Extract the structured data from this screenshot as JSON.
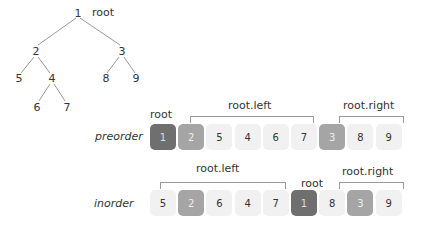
{
  "tree": {
    "root_label": "root",
    "nodes": [
      {
        "v": "1",
        "x": 78,
        "y": 13
      },
      {
        "v": "2",
        "x": 36,
        "y": 51
      },
      {
        "v": "3",
        "x": 122,
        "y": 51
      },
      {
        "v": "5",
        "x": 19,
        "y": 78
      },
      {
        "v": "4",
        "x": 52,
        "y": 78
      },
      {
        "v": "8",
        "x": 106,
        "y": 78
      },
      {
        "v": "9",
        "x": 136,
        "y": 78
      },
      {
        "v": "6",
        "x": 37,
        "y": 107
      },
      {
        "v": "7",
        "x": 67,
        "y": 107
      }
    ]
  },
  "preorder": {
    "label": "preorder",
    "cells": [
      "1",
      "2",
      "5",
      "4",
      "6",
      "7",
      "3",
      "8",
      "9"
    ],
    "styles": [
      "dark",
      "mid",
      "",
      "",
      "",
      "",
      "mid",
      "",
      ""
    ],
    "root_label": "root",
    "left_label": "root.left",
    "right_label": "root.right"
  },
  "inorder": {
    "label": "inorder",
    "cells": [
      "5",
      "2",
      "6",
      "4",
      "7",
      "1",
      "8",
      "3",
      "9"
    ],
    "styles": [
      "",
      "mid",
      "",
      "",
      "",
      "dark",
      "",
      "mid",
      ""
    ],
    "root_label": "root",
    "left_label": "root.left",
    "right_label": "root.right"
  },
  "colors": {
    "root": "#6f6f6f",
    "subroot": "#a5a5a5",
    "cell": "#f1f1f1"
  }
}
